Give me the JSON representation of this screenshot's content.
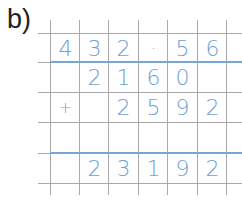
{
  "label": "b)",
  "colors": {
    "grid": "#a9a9a9",
    "digits": "#6e9fd3",
    "rule": "#7aa6d6"
  },
  "rows": [
    [
      "4",
      "3",
      "2",
      "·",
      "5",
      "6"
    ],
    [
      "",
      "2",
      "1",
      "6",
      "0",
      ""
    ],
    [
      "+",
      "",
      "2",
      "5",
      "9",
      "2"
    ],
    [
      "",
      "",
      "",
      "",
      "",
      ""
    ],
    [
      "",
      "2",
      "3",
      "1",
      "9",
      "2"
    ]
  ]
}
